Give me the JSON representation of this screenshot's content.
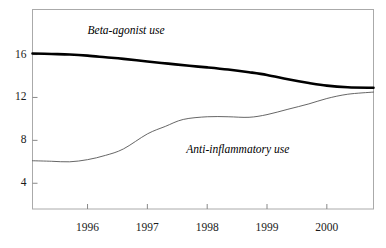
{
  "chart_data": {
    "type": "line",
    "title": "",
    "subtitle": "",
    "xlabel": "",
    "ylabel": "",
    "xlim": [
      1995.08,
      2000.78
    ],
    "ylim": [
      1.6,
      20.2
    ],
    "grid": false,
    "legend_position": "inline-annotations",
    "x_ticks": [
      1996,
      1997,
      1998,
      1999,
      2000
    ],
    "x_tick_labels": [
      "1996",
      "1997",
      "1998",
      "1999",
      "2000"
    ],
    "y_ticks": [
      4,
      8,
      12,
      16
    ],
    "y_tick_labels": [
      "4",
      "8",
      "12",
      "16"
    ],
    "series": [
      {
        "name": "Beta-agonist use",
        "label": "Beta-agonist use",
        "color": "#000000",
        "width": 2.6,
        "x": [
          1995.08,
          1995.4,
          1995.7,
          1996.0,
          1996.3,
          1996.6,
          1997.0,
          1997.35,
          1997.7,
          1998.0,
          1998.35,
          1998.7,
          1999.0,
          1999.35,
          1999.7,
          2000.0,
          2000.35,
          2000.78
        ],
        "values": [
          16.1,
          16.05,
          16.0,
          15.9,
          15.75,
          15.6,
          15.35,
          15.15,
          14.95,
          14.8,
          14.6,
          14.35,
          14.1,
          13.7,
          13.35,
          13.1,
          12.95,
          12.9
        ]
      },
      {
        "name": "Anti-inflammatory use",
        "label": "Anti-inflammatory use",
        "color": "#555555",
        "width": 0.9,
        "x": [
          1995.08,
          1995.4,
          1995.7,
          1996.0,
          1996.3,
          1996.6,
          1997.0,
          1997.3,
          1997.6,
          1998.0,
          1998.35,
          1998.7,
          1999.0,
          1999.35,
          1999.7,
          2000.0,
          2000.35,
          2000.78
        ],
        "values": [
          6.1,
          6.05,
          6.0,
          6.2,
          6.6,
          7.2,
          8.6,
          9.3,
          9.95,
          10.2,
          10.2,
          10.15,
          10.4,
          10.9,
          11.4,
          11.9,
          12.3,
          12.5
        ]
      }
    ],
    "annotations": [
      {
        "text": "Beta-agonist use",
        "x": 1996.0,
        "y": 18.1,
        "style": "italic"
      },
      {
        "text": "Anti-inflammatory use",
        "x": 1997.65,
        "y": 7.0,
        "style": "italic"
      }
    ],
    "colors": {
      "frame": "#aaaaaa",
      "tick": "#888888",
      "text": "#1a1a1a",
      "beta_agonist": "#000000",
      "anti_inflammatory": "#555555",
      "background": "#ffffff"
    }
  }
}
